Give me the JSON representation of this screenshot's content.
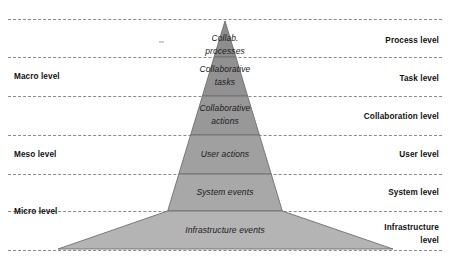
{
  "figure": {
    "type": "pyramid-diagram",
    "background_color": "#ffffff",
    "apex": {
      "x": 225,
      "y": 21
    },
    "base": {
      "left_x": 58,
      "right_x": 393,
      "y": 249
    },
    "outline_color": "#6e6e6e"
  },
  "tiers": [
    {
      "id": "process",
      "label": "Collab.\nprocesses",
      "fill": "#8d8d8d",
      "top_y": 21,
      "bottom_y": 57
    },
    {
      "id": "task",
      "label": "Collaborative\ntasks",
      "fill": "#919191",
      "top_y": 57,
      "bottom_y": 96
    },
    {
      "id": "collaboration",
      "label": "Collaborative\nactions",
      "fill": "#989898",
      "top_y": 96,
      "bottom_y": 135
    },
    {
      "id": "user",
      "label": "User actions",
      "fill": "#a0a0a0",
      "top_y": 135,
      "bottom_y": 174
    },
    {
      "id": "system",
      "label": "System events",
      "fill": "#a8a8a8",
      "top_y": 174,
      "bottom_y": 211
    },
    {
      "id": "infrastructure",
      "label": "Infrastructure events",
      "fill": "#b4b4b4",
      "top_y": 211,
      "bottom_y": 249
    }
  ],
  "left_labels": [
    {
      "id": "macro",
      "text": "Macro level",
      "y": 71
    },
    {
      "id": "meso",
      "text": "Meso level",
      "y": 149
    },
    {
      "id": "micro",
      "text": "Micro level",
      "y": 206
    }
  ],
  "right_labels": [
    {
      "id": "process-level",
      "text": "Process level",
      "y": 35
    },
    {
      "id": "task-level",
      "text": "Task level",
      "y": 73
    },
    {
      "id": "collaboration-level",
      "text": "Collaboration level",
      "y": 111
    },
    {
      "id": "user-level",
      "text": "User level",
      "y": 149
    },
    {
      "id": "system-level",
      "text": "System level",
      "y": 187
    },
    {
      "id": "infrastructure-level",
      "text": "Infrastructure\nlevel",
      "y": 221
    }
  ],
  "dashed_lines": [
    {
      "id": "top-rule",
      "y": 19
    },
    {
      "id": "process-task-rule",
      "y": 57
    },
    {
      "id": "task-collab-rule",
      "y": 96
    },
    {
      "id": "collab-user-rule",
      "y": 135
    },
    {
      "id": "user-system-rule",
      "y": 174
    },
    {
      "id": "system-infra-rule",
      "y": 211
    },
    {
      "id": "base-rule",
      "y": 250
    }
  ],
  "colors": {
    "dash": "#8a8a8a",
    "text": "#1a1a1a",
    "tier_outline": "#6e6e6e"
  }
}
